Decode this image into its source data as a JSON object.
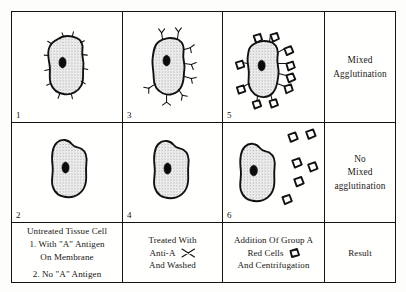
{
  "diagram": {
    "panels": [
      {
        "number": "1",
        "name": "untreated-cell-with-antigen",
        "description": "Tissue cell with A antigen spikes on membrane"
      },
      {
        "number": "3",
        "name": "antibody-treated-cell-with-antigen",
        "description": "Cell coated with anti-A antibody molecules"
      },
      {
        "number": "5",
        "name": "agglutinated-cell-with-red-cells",
        "description": "Group A red cells bound to antibodies on cell surface"
      },
      {
        "number": "2",
        "name": "untreated-cell-no-antigen",
        "description": "Tissue cell without A antigen, smooth membrane"
      },
      {
        "number": "4",
        "name": "antibody-treated-cell-no-antigen",
        "description": "Cell after anti-A treatment and washing, no antibody bound"
      },
      {
        "number": "6",
        "name": "free-red-cells",
        "description": "Group A red cells remain free, not attached to cell"
      }
    ],
    "results": {
      "positive": [
        "Mixed",
        "Agglutination"
      ],
      "negative": [
        "No",
        "Mixed",
        "agglutination"
      ]
    },
    "captions": {
      "column1": [
        "Untreated Tissue Cell",
        "1. With \"A\" Antigen",
        "On Membrane",
        "2. No \"A\" Antigen"
      ],
      "column2": {
        "line1": "Treated With",
        "line2": "Anti-A",
        "line3": "And Washed",
        "glyph": "antibody-glyph"
      },
      "column3": {
        "line1": "Addition Of Group A",
        "line2": "Red Cells",
        "line3": "And Centrifugation",
        "glyph": "red-cell-glyph"
      },
      "column4": "Result"
    },
    "colors": {
      "ink": "#111111",
      "paper": "#fdfdfb",
      "nucleus": "#0b0b0b"
    }
  }
}
